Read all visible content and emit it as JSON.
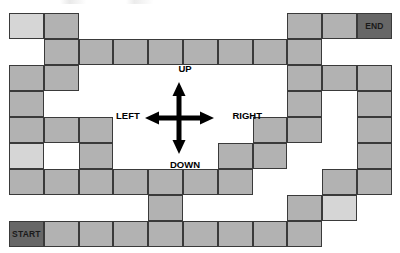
{
  "figure": {
    "type": "maze-grid"
  },
  "grid": {
    "columns": 11,
    "rows": 9,
    "origin_x": 9,
    "origin_y": 13,
    "cell_width": 34.8,
    "cell_height": 26,
    "colors": {
      "tile": "#b2b2b2",
      "tile_light": "#d6d6d6",
      "tile_marker": "#676767",
      "border": "#3a3a3a",
      "background": "#ffffff"
    },
    "cells": [
      {
        "row": 0,
        "col": 0,
        "shade": "light",
        "label": ""
      },
      {
        "row": 0,
        "col": 1,
        "shade": "normal",
        "label": ""
      },
      {
        "row": 0,
        "col": 8,
        "shade": "normal",
        "label": ""
      },
      {
        "row": 0,
        "col": 9,
        "shade": "normal",
        "label": ""
      },
      {
        "row": 0,
        "col": 10,
        "shade": "dark",
        "label": "END"
      },
      {
        "row": 1,
        "col": 1,
        "shade": "normal",
        "label": ""
      },
      {
        "row": 1,
        "col": 2,
        "shade": "normal",
        "label": ""
      },
      {
        "row": 1,
        "col": 3,
        "shade": "normal",
        "label": ""
      },
      {
        "row": 1,
        "col": 4,
        "shade": "normal",
        "label": ""
      },
      {
        "row": 1,
        "col": 5,
        "shade": "normal",
        "label": ""
      },
      {
        "row": 1,
        "col": 6,
        "shade": "normal",
        "label": ""
      },
      {
        "row": 1,
        "col": 7,
        "shade": "normal",
        "label": ""
      },
      {
        "row": 1,
        "col": 8,
        "shade": "normal",
        "label": ""
      },
      {
        "row": 2,
        "col": 0,
        "shade": "normal",
        "label": ""
      },
      {
        "row": 2,
        "col": 1,
        "shade": "normal",
        "label": ""
      },
      {
        "row": 2,
        "col": 8,
        "shade": "normal",
        "label": ""
      },
      {
        "row": 2,
        "col": 9,
        "shade": "normal",
        "label": ""
      },
      {
        "row": 2,
        "col": 10,
        "shade": "normal",
        "label": ""
      },
      {
        "row": 3,
        "col": 0,
        "shade": "normal",
        "label": ""
      },
      {
        "row": 3,
        "col": 8,
        "shade": "normal",
        "label": ""
      },
      {
        "row": 3,
        "col": 10,
        "shade": "normal",
        "label": ""
      },
      {
        "row": 4,
        "col": 0,
        "shade": "normal",
        "label": ""
      },
      {
        "row": 4,
        "col": 1,
        "shade": "normal",
        "label": ""
      },
      {
        "row": 4,
        "col": 2,
        "shade": "normal",
        "label": ""
      },
      {
        "row": 4,
        "col": 7,
        "shade": "normal",
        "label": ""
      },
      {
        "row": 4,
        "col": 8,
        "shade": "normal",
        "label": ""
      },
      {
        "row": 4,
        "col": 10,
        "shade": "normal",
        "label": ""
      },
      {
        "row": 5,
        "col": 0,
        "shade": "light",
        "label": ""
      },
      {
        "row": 5,
        "col": 2,
        "shade": "normal",
        "label": ""
      },
      {
        "row": 5,
        "col": 6,
        "shade": "normal",
        "label": ""
      },
      {
        "row": 5,
        "col": 7,
        "shade": "normal",
        "label": ""
      },
      {
        "row": 5,
        "col": 10,
        "shade": "normal",
        "label": ""
      },
      {
        "row": 6,
        "col": 0,
        "shade": "normal",
        "label": ""
      },
      {
        "row": 6,
        "col": 1,
        "shade": "normal",
        "label": ""
      },
      {
        "row": 6,
        "col": 2,
        "shade": "normal",
        "label": ""
      },
      {
        "row": 6,
        "col": 3,
        "shade": "normal",
        "label": ""
      },
      {
        "row": 6,
        "col": 4,
        "shade": "normal",
        "label": ""
      },
      {
        "row": 6,
        "col": 5,
        "shade": "normal",
        "label": ""
      },
      {
        "row": 6,
        "col": 6,
        "shade": "normal",
        "label": ""
      },
      {
        "row": 6,
        "col": 9,
        "shade": "normal",
        "label": ""
      },
      {
        "row": 6,
        "col": 10,
        "shade": "normal",
        "label": ""
      },
      {
        "row": 7,
        "col": 4,
        "shade": "normal",
        "label": ""
      },
      {
        "row": 7,
        "col": 8,
        "shade": "normal",
        "label": ""
      },
      {
        "row": 7,
        "col": 9,
        "shade": "light",
        "label": ""
      },
      {
        "row": 8,
        "col": 0,
        "shade": "dark",
        "label": "START"
      },
      {
        "row": 8,
        "col": 1,
        "shade": "normal",
        "label": ""
      },
      {
        "row": 8,
        "col": 2,
        "shade": "normal",
        "label": ""
      },
      {
        "row": 8,
        "col": 3,
        "shade": "normal",
        "label": ""
      },
      {
        "row": 8,
        "col": 4,
        "shade": "normal",
        "label": ""
      },
      {
        "row": 8,
        "col": 5,
        "shade": "normal",
        "label": ""
      },
      {
        "row": 8,
        "col": 6,
        "shade": "normal",
        "label": ""
      },
      {
        "row": 8,
        "col": 7,
        "shade": "normal",
        "label": ""
      },
      {
        "row": 8,
        "col": 8,
        "shade": "normal",
        "label": ""
      }
    ]
  },
  "markers": {
    "start_label": "START",
    "end_label": "END"
  },
  "compass": {
    "up_label": "UP",
    "down_label": "DOWN",
    "left_label": "LEFT",
    "right_label": "RIGHT",
    "arrow_color": "#000000"
  }
}
